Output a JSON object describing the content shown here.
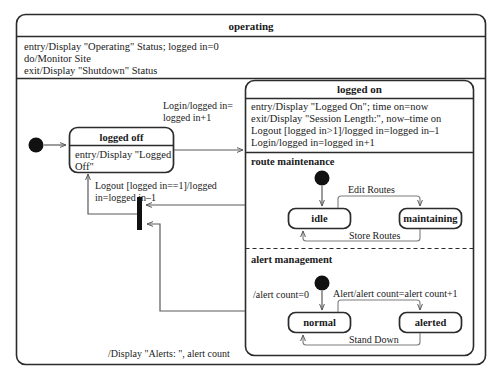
{
  "diagram": {
    "type": "uml-state-machine",
    "root_state": {
      "name": "operating",
      "body_lines": [
        "entry/Display \"Operating\" Status; logged in=0",
        "do/Monitor Site",
        "exit/Display \"Shutdown\" Status"
      ]
    },
    "states": {
      "logged_off": {
        "name": "logged off",
        "body_lines": [
          "entry/Display \"Logged",
          "Off\""
        ]
      },
      "logged_on": {
        "name": "logged on",
        "body_lines": [
          "entry/Display \"Logged On\"; time on=now",
          "exit/Display \"Session Length:\", now–time on",
          "Logout [logged in>1]/logged in=logged in–1",
          "Login/logged in=logged in+1"
        ]
      },
      "idle": {
        "name": "idle"
      },
      "maintaining": {
        "name": "maintaining"
      },
      "normal": {
        "name": "normal"
      },
      "alerted": {
        "name": "alerted"
      }
    },
    "regions": [
      {
        "id": "route-maintenance",
        "label": "route maintenance"
      },
      {
        "id": "alert-management",
        "label": "alert management"
      }
    ],
    "transitions": [
      {
        "id": "login",
        "from": "logged off",
        "to": "logged on",
        "label_lines": [
          "Login/logged in=",
          "logged in+1"
        ]
      },
      {
        "id": "logout",
        "from": "join",
        "to": "logged off",
        "label_lines": [
          "Logout [logged in==1]/logged",
          "in=logged in–1"
        ]
      },
      {
        "id": "display-alerts",
        "from": "alert management",
        "to": "join",
        "label_lines": [
          "/Display \"Alerts: \", alert count"
        ]
      },
      {
        "id": "edit-routes",
        "from": "idle",
        "to": "maintaining",
        "label_lines": [
          "Edit Routes"
        ]
      },
      {
        "id": "store-routes",
        "from": "maintaining",
        "to": "idle",
        "label_lines": [
          "Store Routes"
        ]
      },
      {
        "id": "alert",
        "from": "normal",
        "to": "alerted",
        "label_lines": [
          "Alert/alert count=alert count+1"
        ]
      },
      {
        "id": "stand-down",
        "from": "alerted",
        "to": "normal",
        "label_lines": [
          "Stand Down"
        ]
      },
      {
        "id": "init-alert-count",
        "from": "initial",
        "to": "normal",
        "label_lines": [
          "/alert count=0"
        ]
      }
    ],
    "pseudostates": [
      {
        "id": "initial-operating",
        "kind": "initial"
      },
      {
        "id": "initial-route-maintenance",
        "kind": "initial"
      },
      {
        "id": "initial-alert-management",
        "kind": "initial"
      },
      {
        "id": "join-bar",
        "kind": "join"
      }
    ],
    "colors": {
      "stroke": "#2b2b2b",
      "thin_stroke": "#6b6b6b",
      "fill": "#ffffff",
      "solid": "#111111",
      "background": "#ffffff"
    }
  }
}
